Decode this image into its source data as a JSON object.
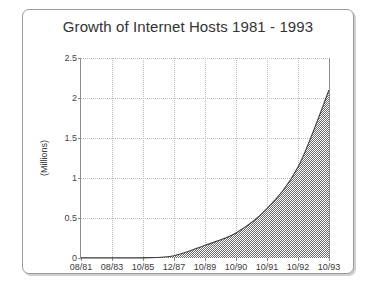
{
  "chart_data": {
    "type": "area",
    "title": "Growth of Internet Hosts 1981 - 1993",
    "xlabel": "",
    "ylabel": "(Millions)",
    "categories": [
      "08/81",
      "08/83",
      "10/85",
      "12/87",
      "10/89",
      "10/90",
      "10/91",
      "10/92",
      "10/93"
    ],
    "values": [
      0.0002,
      0.0006,
      0.0019,
      0.028,
      0.159,
      0.313,
      0.617,
      1.136,
      2.1
    ],
    "ylim": [
      0,
      2.5
    ],
    "yticks": [
      "0",
      "0.5",
      "1",
      "1.5",
      "2",
      "2.5"
    ],
    "ytick_values": [
      0,
      0.5,
      1,
      1.5,
      2,
      2.5
    ],
    "grid": true,
    "legend": false,
    "fill_pattern": "checkerboard",
    "fill_color": "#808080",
    "line_color": "#444444"
  },
  "frame": {
    "border_color": "#9a9a9a",
    "shadow_color": "#cfcfcf"
  }
}
